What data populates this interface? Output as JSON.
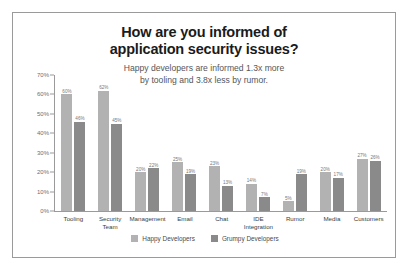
{
  "chart_data": {
    "type": "bar",
    "title": "How are you informed of application security issues?",
    "title_line1": "How are you informed of",
    "title_line2": "application security issues?",
    "subtitle": "Happy developers are informed 1.3x more by tooling and 3.8x less by rumor.",
    "subtitle_line1": "Happy developers are informed 1.3x more",
    "subtitle_line2": "by tooling and 3.8x less by rumor.",
    "xlabel": "",
    "ylabel": "",
    "ylim": [
      0,
      70
    ],
    "grid": false,
    "legend_position": "bottom",
    "ytick_labels": [
      "70%",
      "60%",
      "50%",
      "40%",
      "30%",
      "20%",
      "10%",
      "0%"
    ],
    "ytick_values": [
      70,
      60,
      50,
      40,
      30,
      20,
      10,
      0
    ],
    "categories": [
      "Tooling",
      "Security Team",
      "Management",
      "Email",
      "Chat",
      "IDE Integration",
      "Rumor",
      "Media",
      "Customers"
    ],
    "category_lines": [
      [
        "Tooling"
      ],
      [
        "Security",
        "Team"
      ],
      [
        "Management"
      ],
      [
        "Email"
      ],
      [
        "Chat"
      ],
      [
        "IDE",
        "Integration"
      ],
      [
        "Rumor"
      ],
      [
        "Media"
      ],
      [
        "Customers"
      ]
    ],
    "series": [
      {
        "name": "Happy Developers",
        "color": "#b2b2b2",
        "values": [
          60,
          62,
          20,
          25,
          23,
          14,
          5,
          20,
          27
        ],
        "labels": [
          "60%",
          "62%",
          "20%",
          "25%",
          "23%",
          "14%",
          "5%",
          "20%",
          "27%"
        ]
      },
      {
        "name": "Grumpy Developers",
        "color": "#8a8a8a",
        "values": [
          46,
          45,
          22,
          19,
          13,
          7,
          19,
          17,
          26
        ],
        "labels": [
          "46%",
          "45%",
          "22%",
          "19%",
          "13%",
          "7%",
          "19%",
          "17%",
          "26%"
        ]
      }
    ]
  },
  "legend": {
    "items": [
      {
        "label": "Happy Developers",
        "color": "#b2b2b2"
      },
      {
        "label": "Grumpy Developers",
        "color": "#8a8a8a"
      }
    ]
  },
  "colors": {
    "happy": "#b2b2b2",
    "grumpy": "#8a8a8a",
    "axis": "#9a9a9a",
    "border": "#9a9a9a",
    "title_text": "#1b1b1b",
    "subtitle_text": "#55565a",
    "background": "#ffffff"
  }
}
